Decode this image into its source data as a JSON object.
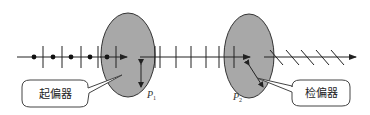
{
  "diagram": {
    "title": "",
    "colors": {
      "line": "#222222",
      "ellipse_fill": "#a8a8a8",
      "ellipse_stroke": "#333333",
      "callout_stroke": "#444444",
      "background": "#ffffff"
    },
    "nodes": [
      {
        "id": "P1",
        "label": "P",
        "subscript": "1",
        "type": "polarizer-ellipse"
      },
      {
        "id": "P2",
        "label": "P",
        "subscript": "2",
        "type": "polarizer-ellipse"
      }
    ],
    "callouts": [
      {
        "id": "polarizer",
        "text": "起偏器",
        "points_to": "P1"
      },
      {
        "id": "analyzer",
        "text": "检偏器",
        "points_to": "P2"
      }
    ],
    "segments": [
      {
        "id": "unpolarized",
        "description": "natural light: dots and vertical bars"
      },
      {
        "id": "linear-vertical",
        "description": "vertically polarized light between P1 and P2"
      },
      {
        "id": "linear-oblique",
        "description": "oblique polarized light after P2"
      }
    ]
  }
}
